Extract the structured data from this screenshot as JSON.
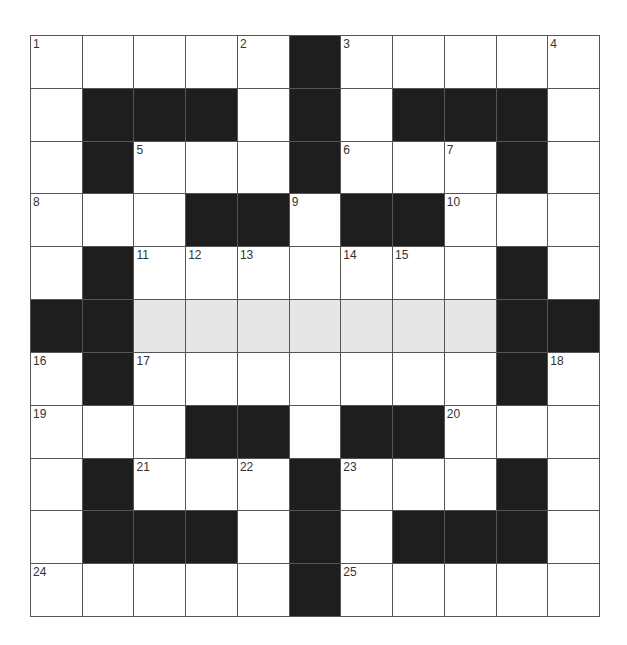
{
  "puzzle": {
    "rows": 11,
    "cols": 11,
    "legend": {
      "#": "black",
      ".": "white",
      "S": "shaded"
    },
    "grid": [
      ". . . . . # . . . . .",
      ". # # # . # . # # # .",
      ". # . . . # . . . # .",
      ". . . # # . # # . . .",
      ". # . . . . . . . # .",
      "# # S S S S S S S # #",
      ". # . . . . . . . # .",
      ". . . # # . # # . . .",
      ". # . . . # . . . # .",
      ". # # # . # . # # # .",
      ". . . . . # . . . . ."
    ],
    "numbers": [
      {
        "n": "1",
        "r": 0,
        "c": 0
      },
      {
        "n": "2",
        "r": 0,
        "c": 4
      },
      {
        "n": "3",
        "r": 0,
        "c": 6
      },
      {
        "n": "4",
        "r": 0,
        "c": 10
      },
      {
        "n": "5",
        "r": 2,
        "c": 2
      },
      {
        "n": "6",
        "r": 2,
        "c": 6
      },
      {
        "n": "7",
        "r": 2,
        "c": 8
      },
      {
        "n": "8",
        "r": 3,
        "c": 0
      },
      {
        "n": "9",
        "r": 3,
        "c": 5
      },
      {
        "n": "10",
        "r": 3,
        "c": 8
      },
      {
        "n": "11",
        "r": 4,
        "c": 2
      },
      {
        "n": "12",
        "r": 4,
        "c": 3
      },
      {
        "n": "13",
        "r": 4,
        "c": 4
      },
      {
        "n": "14",
        "r": 4,
        "c": 6
      },
      {
        "n": "15",
        "r": 4,
        "c": 7
      },
      {
        "n": "16",
        "r": 6,
        "c": 0
      },
      {
        "n": "17",
        "r": 6,
        "c": 2
      },
      {
        "n": "18",
        "r": 6,
        "c": 10
      },
      {
        "n": "19",
        "r": 7,
        "c": 0
      },
      {
        "n": "20",
        "r": 7,
        "c": 8
      },
      {
        "n": "21",
        "r": 8,
        "c": 2
      },
      {
        "n": "22",
        "r": 8,
        "c": 4
      },
      {
        "n": "23",
        "r": 8,
        "c": 6
      },
      {
        "n": "24",
        "r": 10,
        "c": 0
      },
      {
        "n": "25",
        "r": 10,
        "c": 6
      }
    ],
    "colors": {
      "block": "#1e1e1e",
      "shaded": "#e6e6e6",
      "white": "#ffffff",
      "gridline": "#555555"
    }
  }
}
